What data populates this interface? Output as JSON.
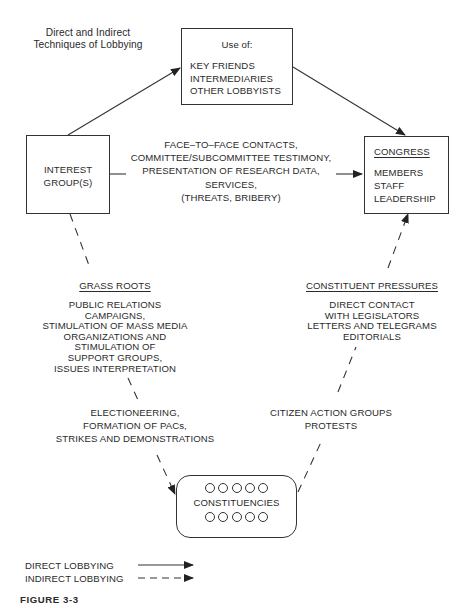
{
  "title": {
    "line1": "Direct and Indirect",
    "line2": "Techniques of Lobbying"
  },
  "nodes": {
    "use_of": {
      "header": "Use of:",
      "items": [
        "KEY FRIENDS",
        "INTERMEDIARIES",
        "OTHER LOBBYISTS"
      ]
    },
    "interest_group": {
      "line1": "INTEREST",
      "line2": "GROUP(S)"
    },
    "congress": {
      "header": "CONGRESS",
      "items": [
        "MEMBERS",
        "STAFF",
        "LEADERSHIP"
      ]
    },
    "constituencies": {
      "label": "CONSTITUENCIES",
      "circles_top": 5,
      "circles_bottom": 5
    }
  },
  "direct_path": {
    "items": [
      "FACE–TO–FACE CONTACTS,",
      "COMMITTEE/SUBCOMMITTEE TESTIMONY,",
      "PRESENTATION OF RESEARCH DATA,",
      "SERVICES,",
      "(THREATS, BRIBERY)"
    ]
  },
  "grass_roots": {
    "header": "GRASS ROOTS",
    "items": [
      "PUBLIC RELATIONS",
      "CAMPAIGNS,",
      "STIMULATION OF MASS MEDIA",
      "ORGANIZATIONS AND",
      "STIMULATION OF",
      "SUPPORT GROUPS,",
      "ISSUES INTERPRETATION"
    ],
    "items2": [
      "ELECTIONEERING,",
      "FORMATION OF PACs,",
      "STRIKES AND DEMONSTRATIONS"
    ]
  },
  "constituent_pressures": {
    "header": "CONSTITUENT PRESSURES",
    "items": [
      "DIRECT CONTACT",
      "WITH LEGISLATORS",
      "LETTERS AND TELEGRAMS",
      "EDITORIALS"
    ],
    "items2": [
      "CITIZEN ACTION GROUPS",
      "PROTESTS"
    ]
  },
  "legend": {
    "direct": "DIRECT LOBBYING",
    "indirect": "INDIRECT LOBBYING"
  },
  "caption": "FIGURE 3-3"
}
